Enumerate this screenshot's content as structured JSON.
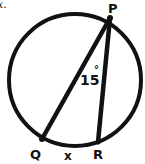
{
  "diagram": {
    "type": "circle-inscribed-angle",
    "fragment_text": "x.",
    "points": {
      "P": {
        "label": "P"
      },
      "Q": {
        "label": "Q"
      },
      "R": {
        "label": "R"
      }
    },
    "angle": {
      "vertex": "P",
      "value": "15",
      "unit": "°"
    },
    "arc": {
      "from": "Q",
      "to": "R",
      "label": "x"
    },
    "colors": {
      "stroke": "#111111",
      "background": "#ffffff"
    }
  }
}
